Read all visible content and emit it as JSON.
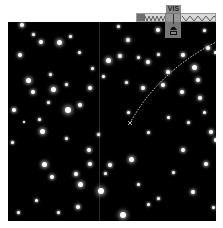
{
  "viewer": {
    "band_label": "VIS",
    "spectrum": {
      "selected_band": "VIS",
      "colors": {
        "bar_bg": "#d8d8d8",
        "wave": "#666666",
        "marker": "#8c8c8c"
      }
    },
    "sky": {
      "background": "#000000",
      "stars": [
        [
          14,
          3,
          2
        ],
        [
          25,
          12,
          1.5
        ],
        [
          33,
          20,
          2
        ],
        [
          51,
          20,
          2.5
        ],
        [
          62,
          14,
          1.5
        ],
        [
          71,
          30,
          1.5
        ],
        [
          12,
          33,
          2
        ],
        [
          20,
          58,
          2.5
        ],
        [
          42,
          52,
          1.5
        ],
        [
          58,
          62,
          1.5
        ],
        [
          25,
          70,
          2
        ],
        [
          45,
          67,
          2.5
        ],
        [
          40,
          80,
          1.5
        ],
        [
          60,
          88,
          3
        ],
        [
          72,
          83,
          2
        ],
        [
          16,
          100,
          1
        ],
        [
          31,
          97,
          1.5
        ],
        [
          34,
          109,
          2.5
        ],
        [
          58,
          116,
          1.5
        ],
        [
          82,
          66,
          2
        ],
        [
          84,
          46,
          1.5
        ],
        [
          95,
          54,
          1.5
        ],
        [
          36,
          142,
          2.5
        ],
        [
          44,
          155,
          2
        ],
        [
          28,
          178,
          1.5
        ],
        [
          82,
          142,
          2
        ],
        [
          81,
          128,
          2
        ],
        [
          68,
          152,
          2
        ],
        [
          72,
          162,
          2.5
        ],
        [
          93,
          169,
          3
        ],
        [
          97,
          151,
          1.5
        ],
        [
          100,
          38,
          2.5
        ],
        [
          120,
          18,
          2
        ],
        [
          112,
          34,
          2
        ],
        [
          130,
          35,
          1.5
        ],
        [
          140,
          40,
          2
        ],
        [
          150,
          32,
          1.5
        ],
        [
          160,
          50,
          2
        ],
        [
          175,
          33,
          2
        ],
        [
          186,
          45,
          2.5
        ],
        [
          200,
          26,
          2
        ],
        [
          207,
          30,
          1.5
        ],
        [
          118,
          60,
          1.5
        ],
        [
          135,
          66,
          2
        ],
        [
          155,
          63,
          2
        ],
        [
          174,
          70,
          2
        ],
        [
          192,
          76,
          2
        ],
        [
          175,
          128,
          2
        ],
        [
          198,
          142,
          2
        ],
        [
          130,
          162,
          1.5
        ],
        [
          150,
          176,
          1.5
        ],
        [
          185,
          170,
          2
        ],
        [
          196,
          90,
          1.5
        ],
        [
          203,
          110,
          2
        ],
        [
          208,
          118,
          2
        ],
        [
          123,
          137,
          2.5
        ],
        [
          102,
          143,
          2
        ],
        [
          90,
          112,
          1.5
        ],
        [
          120,
          90,
          1.5
        ],
        [
          140,
          110,
          1.5
        ],
        [
          180,
          100,
          1.5
        ],
        [
          160,
          95,
          1.5
        ],
        [
          10,
          190,
          1.5
        ],
        [
          50,
          190,
          1.5
        ],
        [
          70,
          185,
          2
        ],
        [
          115,
          193,
          3
        ],
        [
          140,
          182,
          1.5
        ],
        [
          165,
          150,
          1.5
        ],
        [
          205,
          185,
          1.5
        ],
        [
          196,
          8,
          1.5
        ],
        [
          150,
          8,
          2
        ],
        [
          110,
          4,
          1.5
        ],
        [
          6,
          88,
          2
        ],
        [
          4,
          120,
          1.5
        ],
        [
          190,
          58,
          2
        ]
      ]
    },
    "trajectory": {
      "color": "#dcdcdc",
      "end_marker": "x"
    }
  }
}
